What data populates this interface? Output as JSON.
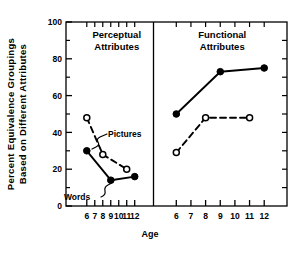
{
  "chart_data": {
    "type": "line",
    "title": "",
    "xlabel": "Age",
    "ylabel": "Percent Equivalence Groupings Based on Different Attributes",
    "ylabel_lines": [
      "Percent  Equivalence  Groupings",
      "Based  on  Different  Attributes"
    ],
    "ylim": [
      0,
      100
    ],
    "yticks": [
      0,
      20,
      40,
      60,
      80,
      100
    ],
    "ytick_labels": [
      "0",
      "20",
      "40",
      "60",
      "80",
      "100"
    ],
    "yminor_step": 10,
    "grid": false,
    "legend_position": "inline-annotations",
    "panels": [
      {
        "name": "perceptual",
        "title_lines": [
          "Perceptual",
          "Attributes"
        ],
        "xlim": [
          5.4,
          12.6
        ],
        "xticks": [
          6,
          7,
          8,
          9,
          10,
          11,
          12
        ],
        "xtick_labels": [
          "6",
          "7",
          "8",
          "9",
          "10",
          "11",
          "12"
        ],
        "series": [
          {
            "name": "Words",
            "marker": "filled-circle",
            "line": "solid",
            "x": [
              6,
              9,
              12
            ],
            "values": [
              30,
              14,
              16
            ]
          },
          {
            "name": "Pictures",
            "marker": "open-circle",
            "line": "dashed",
            "x": [
              6,
              8,
              11
            ],
            "values": [
              48,
              28,
              20
            ]
          }
        ],
        "annotations": [
          {
            "text": "Pictures",
            "series": "Pictures"
          },
          {
            "text": "Words",
            "series": "Words"
          }
        ]
      },
      {
        "name": "functional",
        "title_lines": [
          "Functional",
          "Attributes"
        ],
        "xlim": [
          5.4,
          12.6
        ],
        "xticks": [
          6,
          7,
          8,
          9,
          10,
          11,
          12
        ],
        "xtick_labels": [
          "6",
          "7",
          "8",
          "9",
          "10",
          "11",
          "12"
        ],
        "series": [
          {
            "name": "Words",
            "marker": "filled-circle",
            "line": "solid",
            "x": [
              6,
              9,
              12
            ],
            "values": [
              50,
              73,
              75
            ]
          },
          {
            "name": "Pictures",
            "marker": "open-circle",
            "line": "dashed",
            "x": [
              6,
              8,
              11
            ],
            "values": [
              29,
              48,
              48
            ]
          }
        ],
        "annotations": []
      }
    ],
    "colors": {
      "ink": "#000000",
      "background": "#ffffff"
    }
  }
}
